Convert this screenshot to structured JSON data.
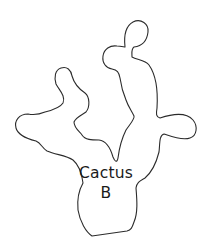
{
  "diagram": {
    "shape": "cactus-outline",
    "label": {
      "line1": "Cactus",
      "line2": "B"
    },
    "colors": {
      "background": "#ffffff",
      "stroke": "#2b2b2b",
      "text": "#1a1a1a"
    }
  }
}
